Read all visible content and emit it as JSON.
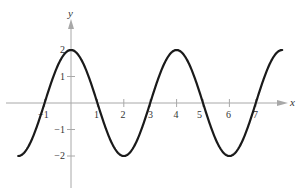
{
  "chart_data": {
    "type": "line",
    "title": "",
    "xlabel": "x",
    "ylabel": "y",
    "function": "y = 2cos(pi*x/2)",
    "xlim": [
      -2.0,
      8.0
    ],
    "ylim": [
      -3.0,
      3.0
    ],
    "grid": false,
    "legend": null,
    "x_ticks": [
      -1,
      1,
      2,
      3,
      4,
      5,
      6,
      7
    ],
    "x_tick_labels": [
      "-1",
      "1",
      "2",
      "3",
      "4",
      "5",
      "6",
      "7"
    ],
    "y_ticks": [
      2,
      1,
      -1,
      -2
    ],
    "y_tick_labels": [
      "2",
      "1",
      "−1",
      "−2"
    ],
    "series": [
      {
        "name": "y = 2cos(πx/2)",
        "x": [
          -2,
          -1.5,
          -1,
          -0.5,
          0,
          0.5,
          1,
          1.5,
          2,
          2.5,
          3,
          3.5,
          4,
          4.5,
          5,
          5.5,
          6,
          6.5,
          7,
          7.5,
          8
        ],
        "values": [
          -2,
          -1.41,
          0,
          1.41,
          2,
          1.41,
          0,
          -1.41,
          -2,
          -1.41,
          0,
          1.41,
          2,
          1.41,
          0,
          -1.41,
          -2,
          -1.41,
          0,
          1.41,
          2
        ]
      }
    ],
    "colors": {
      "curve": "#1a1a1a",
      "axis": "#a8a8a8",
      "text": "#333333"
    }
  },
  "labels": {
    "x_axis": "x",
    "y_axis": "y",
    "xt": {
      "m1": "−1",
      "p1": "1",
      "p2": "2",
      "p3": "3",
      "p4": "4",
      "p5": "5",
      "p6": "6",
      "p7": "7"
    },
    "yt": {
      "p2": "2",
      "p1": "1",
      "m1": "−1",
      "m2": "−2"
    }
  }
}
